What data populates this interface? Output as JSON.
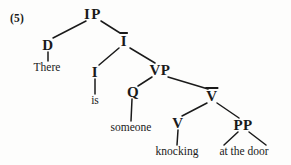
{
  "figure": {
    "number_label": "(5)",
    "sentence": "There is someone knocking at the door",
    "ink_color": "#1a1a1a",
    "background_color": "#fdfdfc"
  },
  "tree": {
    "nodes": {
      "ip": {
        "label": "IP",
        "x": 93,
        "y": 14,
        "kind": "category"
      },
      "d": {
        "label": "D",
        "x": 48,
        "y": 45,
        "kind": "category"
      },
      "ibar": {
        "label": "I",
        "overbar": true,
        "x": 124,
        "y": 41,
        "kind": "category"
      },
      "there": {
        "label": "There",
        "x": 47,
        "y": 68,
        "kind": "terminal"
      },
      "i": {
        "label": "I",
        "x": 95,
        "y": 72,
        "kind": "category"
      },
      "vp": {
        "label": "VP",
        "x": 160,
        "y": 70,
        "kind": "category"
      },
      "is": {
        "label": "is",
        "x": 95,
        "y": 101,
        "kind": "terminal"
      },
      "q": {
        "label": "Q",
        "x": 133,
        "y": 92,
        "kind": "category"
      },
      "vbar": {
        "label": "V",
        "overbar": true,
        "x": 212,
        "y": 96,
        "kind": "category"
      },
      "someone": {
        "label": "someone",
        "x": 131,
        "y": 128,
        "kind": "terminal"
      },
      "v": {
        "label": "V",
        "x": 178,
        "y": 123,
        "kind": "category"
      },
      "pp": {
        "label": "PP",
        "x": 243,
        "y": 125,
        "kind": "category"
      },
      "knocking": {
        "label": "knocking",
        "x": 177,
        "y": 152,
        "kind": "terminal"
      },
      "atthedoor": {
        "label": "at the door",
        "x": 244,
        "y": 152,
        "kind": "terminal"
      }
    },
    "edges": [
      {
        "from": "ip",
        "to": "d",
        "x1": 86,
        "y1": 21,
        "x2": 53,
        "y2": 38
      },
      {
        "from": "ip",
        "to": "ibar",
        "x1": 101,
        "y1": 21,
        "x2": 120,
        "y2": 33
      },
      {
        "from": "d",
        "to": "there",
        "x1": 48,
        "y1": 52,
        "x2": 48,
        "y2": 61
      },
      {
        "from": "ibar",
        "to": "i",
        "x1": 119,
        "y1": 48,
        "x2": 99,
        "y2": 65
      },
      {
        "from": "ibar",
        "to": "vp",
        "x1": 130,
        "y1": 48,
        "x2": 155,
        "y2": 63
      },
      {
        "from": "i",
        "to": "is",
        "x1": 95,
        "y1": 79,
        "x2": 95,
        "y2": 94
      },
      {
        "from": "vp",
        "to": "q",
        "x1": 152,
        "y1": 77,
        "x2": 138,
        "y2": 86
      },
      {
        "from": "vp",
        "to": "vbar",
        "x1": 168,
        "y1": 77,
        "x2": 208,
        "y2": 89
      },
      {
        "from": "q",
        "to": "someone",
        "x1": 132,
        "y1": 99,
        "x2": 131,
        "y2": 121
      },
      {
        "from": "vbar",
        "to": "v",
        "x1": 207,
        "y1": 103,
        "x2": 182,
        "y2": 116
      },
      {
        "from": "vbar",
        "to": "pp",
        "x1": 217,
        "y1": 103,
        "x2": 239,
        "y2": 118
      },
      {
        "from": "v",
        "to": "knocking",
        "x1": 178,
        "y1": 130,
        "x2": 177,
        "y2": 145
      },
      {
        "from": "pp",
        "to": "atthedoor-left",
        "x1": 238,
        "y1": 132,
        "x2": 224,
        "y2": 145
      },
      {
        "from": "pp",
        "to": "atthedoor-right",
        "x1": 249,
        "y1": 132,
        "x2": 266,
        "y2": 145
      }
    ]
  }
}
